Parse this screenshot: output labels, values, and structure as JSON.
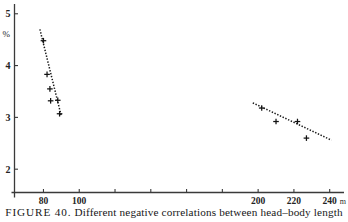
{
  "figure": {
    "caption_number": "FIGURE 40.",
    "caption_text": "Different negative correlations between head–body length"
  },
  "chart_data": {
    "type": "scatter",
    "title": "",
    "xlabel": "",
    "ylabel": "",
    "x_unit": "m",
    "y_unit": "%",
    "xlim": [
      68,
      248
    ],
    "ylim": [
      1.55,
      5.15
    ],
    "grid": false,
    "legend": "none",
    "x_ticks": [
      80,
      100,
      120,
      140,
      160,
      180,
      200,
      220,
      240
    ],
    "x_tick_labels": [
      "80",
      "100",
      "",
      "",
      "",
      "",
      "200",
      "220",
      "240"
    ],
    "y_ticks": [
      2,
      3,
      4,
      5
    ],
    "y_tick_labels": [
      "2",
      "3",
      "4",
      "5"
    ],
    "series": [
      {
        "name": "left-cluster",
        "marker": "plus",
        "points": [
          {
            "x": 80.0,
            "y": 4.48
          },
          {
            "x": 82.0,
            "y": 3.83
          },
          {
            "x": 83.6,
            "y": 3.55
          },
          {
            "x": 84.0,
            "y": 3.32
          },
          {
            "x": 88.0,
            "y": 3.33
          },
          {
            "x": 89.0,
            "y": 3.07
          }
        ],
        "trend": {
          "x1": 78.0,
          "y1": 4.7,
          "x2": 90.0,
          "y2": 3.02
        }
      },
      {
        "name": "right-cluster",
        "marker": "plus",
        "points": [
          {
            "x": 202.0,
            "y": 3.18
          },
          {
            "x": 210.0,
            "y": 2.92
          },
          {
            "x": 222.0,
            "y": 2.92
          },
          {
            "x": 227.0,
            "y": 2.6
          }
        ],
        "trend": {
          "x1": 197.0,
          "y1": 3.28,
          "x2": 241.0,
          "y2": 2.56
        }
      }
    ]
  }
}
